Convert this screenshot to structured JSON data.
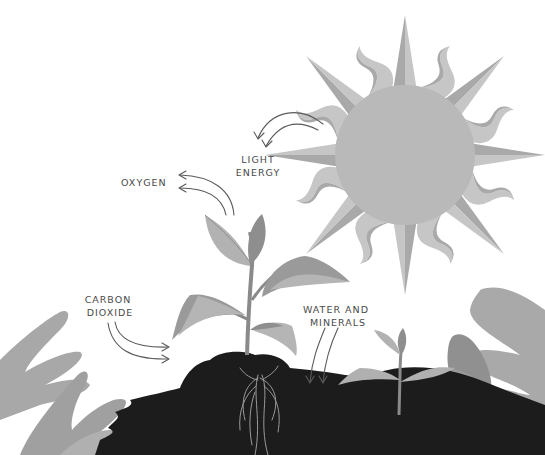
{
  "diagram": {
    "labels": {
      "light_energy": [
        "LIGHT",
        "ENERGY"
      ],
      "oxygen": "OXYGEN",
      "carbon_dioxide": [
        "CARBON",
        "DIOXIDE"
      ],
      "water_minerals": [
        "WATER AND",
        "MINERALS"
      ]
    },
    "colors": {
      "background": "#ffffff",
      "sun_core": "#b9b9b9",
      "sun_ray_light": "#c6c6c6",
      "sun_ray_dark": "#a9a9a9",
      "leaf_light": "#b2b2b2",
      "leaf_dark": "#8e8e8e",
      "stem": "#8a8a8a",
      "soil": "#1c1c1c",
      "roots": "#9a9a9a",
      "foliage": "#a8a8a8",
      "text": "#4a4a4a",
      "arrow": "#5a5a5a"
    }
  }
}
